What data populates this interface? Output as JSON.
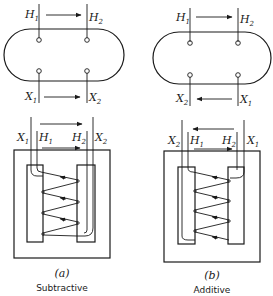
{
  "figure": {
    "panels": [
      {
        "id": "a",
        "caption": "(a)",
        "name": "Subtractive",
        "top": {
          "h1": "H",
          "h1_sub": "1",
          "h2": "H",
          "h2_sub": "2",
          "x_left": "X",
          "x_left_sub": "1",
          "x_right": "X",
          "x_right_sub": "2",
          "h_arrow": "left-to-right",
          "x_arrow": "left-to-right"
        },
        "core": {
          "x_left": "X",
          "x_left_sub": "1",
          "h1": "H",
          "h1_sub": "1",
          "h2": "H",
          "h2_sub": "2",
          "x_right": "X",
          "x_right_sub": "2"
        }
      },
      {
        "id": "b",
        "caption": "(b)",
        "name": "Additive",
        "top": {
          "h1": "H",
          "h1_sub": "1",
          "h2": "H",
          "h2_sub": "2",
          "x_left": "X",
          "x_left_sub": "2",
          "x_right": "X",
          "x_right_sub": "1",
          "h_arrow": "left-to-right",
          "x_arrow": "right-to-left"
        },
        "core": {
          "x_left": "X",
          "x_left_sub": "2",
          "h1": "H",
          "h1_sub": "1",
          "h2": "H",
          "h2_sub": "2",
          "x_right": "X",
          "x_right_sub": "1"
        }
      }
    ],
    "colors": {
      "ink": "#1a1a1a",
      "background": "#ffffff"
    }
  }
}
